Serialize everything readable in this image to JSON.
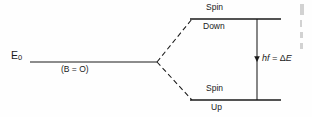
{
  "figure": {
    "type": "energy-level-splitting-diagram",
    "background_color": "#fefefe",
    "ink_color": "#1a1a1a"
  },
  "labels": {
    "base_level": "E",
    "base_level_subscript": "0",
    "field_off": "(B = O)",
    "upper_level_line1": "Spin",
    "upper_level_line2": "Down",
    "lower_level_line1": "Spin",
    "lower_level_line2": "Up",
    "transition_energy_prefix": "hf = ",
    "transition_energy_delta": "Δ",
    "transition_energy_suffix": "E"
  },
  "geometry": {
    "base_line": {
      "x1": 30,
      "y1": 62,
      "x2": 157,
      "y2": 62
    },
    "split_point": {
      "x": 157,
      "y": 62
    },
    "upper_dashed": {
      "x1": 157,
      "y1": 62,
      "x2": 192,
      "y2": 19
    },
    "lower_dashed": {
      "x1": 157,
      "y1": 62,
      "x2": 192,
      "y2": 100
    },
    "upper_level_line": {
      "x1": 190,
      "y1": 19,
      "x2": 281,
      "y2": 19
    },
    "lower_level_line": {
      "x1": 190,
      "y1": 100,
      "x2": 281,
      "y2": 100
    },
    "arrow_line": {
      "x": 257,
      "y1": 19,
      "y2": 100
    },
    "arrow_head_y": 58
  }
}
